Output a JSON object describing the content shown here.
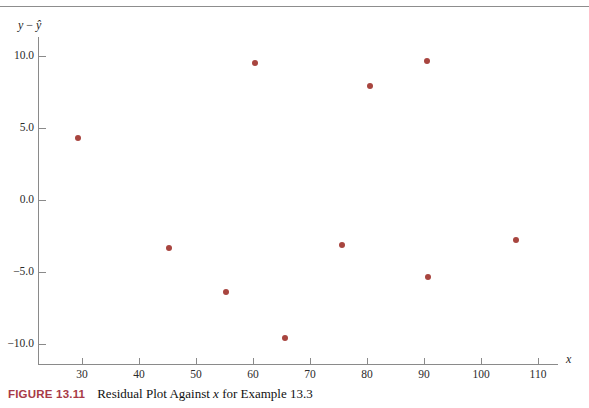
{
  "figure": {
    "label": "FIGURE 13.11",
    "caption": "Residual Plot Against x for Example 13.3",
    "label_color": "#a83a46"
  },
  "chart_data": {
    "type": "scatter",
    "title": "Residual Plot Against x for Example 13.3",
    "xlabel": "x",
    "ylabel": "y − ŷ",
    "xlim": [
      21,
      116
    ],
    "ylim": [
      -11.4,
      11.4
    ],
    "grid": false,
    "legend": null,
    "marker_color": "#a8453f",
    "xticks": [
      30,
      40,
      50,
      60,
      70,
      80,
      90,
      100,
      110
    ],
    "xtick_labels": [
      "30",
      "40",
      "50",
      "60",
      "70",
      "80",
      "90",
      "100",
      "110"
    ],
    "yticks": [
      10.0,
      5.0,
      0.0,
      -5.0,
      -10.0
    ],
    "ytick_labels": [
      "10.0",
      "5.0",
      "0.0",
      "−5.0",
      "−10.0"
    ],
    "points": [
      {
        "x": 29.3,
        "y": 4.3
      },
      {
        "x": 45.3,
        "y": -3.3
      },
      {
        "x": 55.3,
        "y": -6.4
      },
      {
        "x": 60.4,
        "y": 9.5
      },
      {
        "x": 65.6,
        "y": -9.6
      },
      {
        "x": 75.6,
        "y": -3.1
      },
      {
        "x": 80.5,
        "y": 7.9
      },
      {
        "x": 90.5,
        "y": 9.65
      },
      {
        "x": 90.7,
        "y": -5.35
      },
      {
        "x": 106.1,
        "y": -2.8
      }
    ]
  }
}
